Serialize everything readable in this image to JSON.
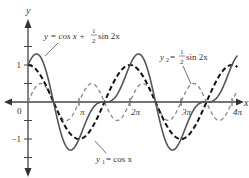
{
  "chart_data": {
    "type": "line",
    "title": "",
    "xlabel": "x",
    "ylabel": "y",
    "xlim": [
      0,
      13.2
    ],
    "ylim": [
      -2.0,
      2.1
    ],
    "grid": false,
    "x_ticks": [
      {
        "value": 3.14159,
        "label": "π"
      },
      {
        "value": 6.28319,
        "label": "2π"
      },
      {
        "value": 9.42478,
        "label": "3π"
      },
      {
        "value": 12.56637,
        "label": "4π"
      }
    ],
    "y_ticks": [
      {
        "value": 1.5,
        "label": ""
      },
      {
        "value": 1,
        "label": "1"
      },
      {
        "value": 0.5,
        "label": ""
      },
      {
        "value": -0.5,
        "label": ""
      },
      {
        "value": -1,
        "label": "−1"
      },
      {
        "value": -1.5,
        "label": ""
      }
    ],
    "origin_label": "0",
    "series": [
      {
        "name": "y = cos x + 1/2 sin 2x",
        "function": "cos(x) + 0.5*sin(2x)",
        "style": "solid",
        "color": "#555555",
        "domain": [
          0,
          12.9
        ]
      },
      {
        "name": "y1 = cos x",
        "function": "cos(x)",
        "style": "dashed",
        "color": "#111111",
        "domain": [
          0,
          12.9
        ]
      },
      {
        "name": "y2 = 1/2 sin 2x",
        "function": "0.5*sin(2x)",
        "style": "dashed",
        "color": "#888888",
        "domain": [
          0,
          12.9
        ]
      }
    ],
    "annotations": [
      {
        "series": 0,
        "text_parts": [
          "y = cos x + ",
          "1",
          "2",
          " sin 2x"
        ],
        "target": [
          0.95,
          1.2
        ]
      },
      {
        "series": 2,
        "text_parts": [
          "y",
          "2",
          " = ",
          "1",
          "2",
          " sin 2x"
        ],
        "target": [
          10.7,
          0.45
        ]
      },
      {
        "series": 1,
        "text_parts": [
          "y",
          "1",
          " = cos x"
        ],
        "target": [
          3.9,
          -0.75
        ]
      }
    ]
  }
}
